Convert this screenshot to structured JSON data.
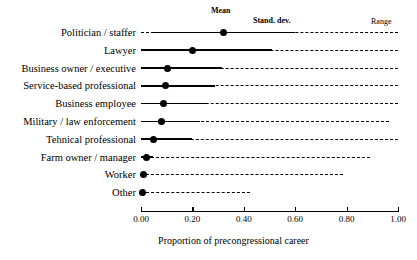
{
  "chart_data": {
    "type": "dot-range",
    "title": "",
    "xlabel": "Proportion of  precongressional career",
    "ylabel": "",
    "xlim": [
      0.0,
      1.0
    ],
    "xticks": [
      "0.00",
      "0.20",
      "0.40",
      "0.60",
      "0.80",
      "1.00"
    ],
    "xtick_values": [
      0.0,
      0.2,
      0.4,
      0.6,
      0.8,
      1.0
    ],
    "grid": false,
    "legend_position": "top-inline",
    "annotations": [
      {
        "name": "mean",
        "label": "Mean"
      },
      {
        "name": "stand-dev",
        "label": "Stand. dev."
      },
      {
        "name": "range",
        "label": "Range"
      }
    ],
    "categories": [
      "Politician / staffer",
      "Lawyer",
      "Business owner / executive",
      "Service-based professional",
      "Business employee",
      "Military / law enforcement",
      "Tehnical professional",
      "Farm owner / manager",
      "Worker",
      "Other"
    ],
    "series": [
      {
        "name": "Mean",
        "values": [
          0.32,
          0.2,
          0.105,
          0.097,
          0.089,
          0.078,
          0.05,
          0.02,
          0.008,
          0.004
        ]
      },
      {
        "name": "SD low",
        "values": [
          0.04,
          0.0,
          0.0,
          0.0,
          0.0,
          0.0,
          0.0,
          0.0,
          0.0,
          0.0
        ]
      },
      {
        "name": "SD high",
        "values": [
          0.6,
          0.51,
          0.315,
          0.288,
          0.261,
          0.23,
          0.2,
          0.045,
          0.018,
          0.006
        ]
      },
      {
        "name": "Range low",
        "values": [
          0.0,
          0.0,
          0.0,
          0.0,
          0.0,
          0.0,
          0.0,
          0.0,
          0.0,
          0.0
        ]
      },
      {
        "name": "Range high",
        "values": [
          1.0,
          1.0,
          1.0,
          1.0,
          1.0,
          0.965,
          1.0,
          0.89,
          0.785,
          0.425
        ]
      }
    ]
  }
}
